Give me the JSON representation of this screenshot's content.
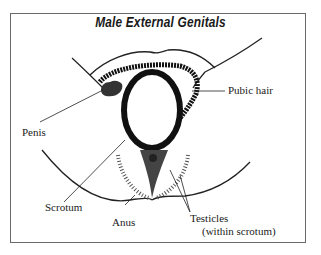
{
  "diagram": {
    "title": "Male External Genitals",
    "labels": {
      "pubic_hair": "Pubic hair",
      "penis": "Penis",
      "scrotum": "Scrotum",
      "anus": "Anus",
      "testicles": "Testicles",
      "testicles_note": "(within scrotum)"
    }
  }
}
